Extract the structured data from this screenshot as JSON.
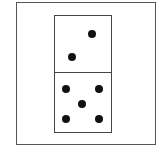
{
  "figure": {
    "type": "domino",
    "top_half": {
      "value": 2,
      "pips": [
        {
          "x": 92,
          "y": 34
        },
        {
          "x": 72,
          "y": 57
        }
      ]
    },
    "bottom_half": {
      "value": 5,
      "pips": [
        {
          "x": 66,
          "y": 89
        },
        {
          "x": 99,
          "y": 89
        },
        {
          "x": 82,
          "y": 104
        },
        {
          "x": 66,
          "y": 119
        },
        {
          "x": 99,
          "y": 119
        }
      ]
    },
    "colors": {
      "pip": "#111111",
      "border": "#444444",
      "background": "#ffffff"
    }
  }
}
